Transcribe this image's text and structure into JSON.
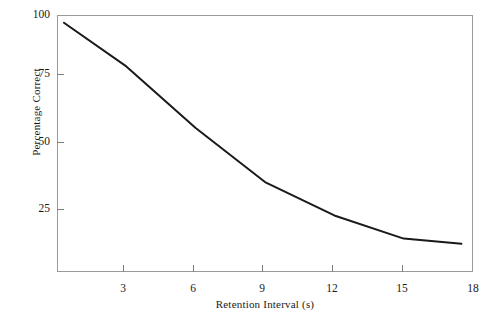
{
  "chart_data": {
    "type": "line",
    "title": "",
    "xlabel": "Retention Interval (s)",
    "ylabel": "Percentage Correct",
    "xlim": [
      0,
      18
    ],
    "ylim": [
      0,
      100
    ],
    "grid": false,
    "legend": "none",
    "xticks": [
      3,
      6,
      9,
      12,
      15,
      18
    ],
    "yticks": [
      25,
      50,
      75,
      100
    ],
    "xtick_labels": [
      "3",
      "6",
      "9",
      "12",
      "15",
      "18"
    ],
    "ytick_labels": [
      "25",
      "50",
      "75",
      "100"
    ],
    "series": [
      {
        "name": "Percentage Correct",
        "x": [
          0.3,
          3.0,
          6.0,
          9.0,
          12.0,
          15.0,
          17.5
        ],
        "values": [
          97,
          80,
          56,
          35,
          22,
          13,
          11
        ]
      }
    ],
    "line_color": "#1a1a1a",
    "line_width": 2,
    "frame_color": "#9a9a9a"
  },
  "axes": {
    "y_axis_title": "Percentage Correct",
    "x_axis_title": "Retention Interval (s)"
  }
}
